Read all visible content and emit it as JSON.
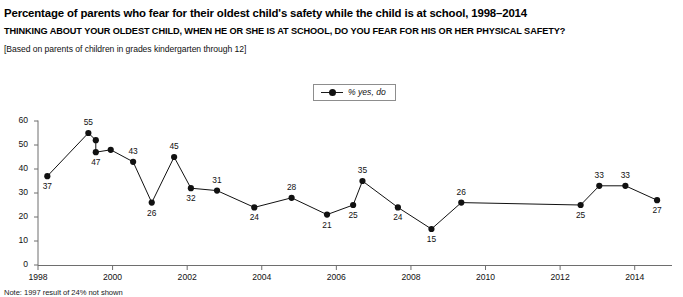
{
  "header": {
    "title": "Percentage of parents who fear for their oldest child's safety while the child is at school, 1998–2014",
    "question": "THINKING ABOUT YOUR OLDEST CHILD, WHEN HE OR SHE IS AT SCHOOL, DO YOU FEAR FOR HIS OR HER PHYSICAL SAFETY?",
    "basis": "[Based on parents of children in grades kindergarten through 12]"
  },
  "legend": {
    "label": "% yes, do",
    "marker_icon": "line-with-dot-marker-icon"
  },
  "footnote": {
    "text": "Note: 1997 result of 24% not shown"
  },
  "chart_data": {
    "type": "line",
    "title": "Percentage of parents who fear for their oldest child's safety while the child is at school, 1998–2014",
    "xlabel": "",
    "ylabel": "",
    "xlim": [
      1998.0,
      2015.0
    ],
    "ylim": [
      0,
      60
    ],
    "grid": false,
    "legend_position": "top-center",
    "series": [
      {
        "name": "% yes, do",
        "color": "#111111",
        "points": [
          {
            "x": 1998.25,
            "y": 37,
            "label": "37",
            "label_pos": "below"
          },
          {
            "x": 1999.35,
            "y": 55,
            "label": "55",
            "label_pos": "above"
          },
          {
            "x": 1999.55,
            "y": 52,
            "label": "",
            "label_pos": "none"
          },
          {
            "x": 1999.55,
            "y": 47,
            "label": "47",
            "label_pos": "below"
          },
          {
            "x": 1999.95,
            "y": 48,
            "label": "",
            "label_pos": "none"
          },
          {
            "x": 2000.55,
            "y": 43,
            "label": "43",
            "label_pos": "above"
          },
          {
            "x": 2001.05,
            "y": 26,
            "label": "26",
            "label_pos": "below"
          },
          {
            "x": 2001.65,
            "y": 45,
            "label": "45",
            "label_pos": "above"
          },
          {
            "x": 2002.1,
            "y": 32,
            "label": "32",
            "label_pos": "below"
          },
          {
            "x": 2002.8,
            "y": 31,
            "label": "31",
            "label_pos": "above"
          },
          {
            "x": 2003.8,
            "y": 24,
            "label": "24",
            "label_pos": "below"
          },
          {
            "x": 2004.8,
            "y": 28,
            "label": "28",
            "label_pos": "above"
          },
          {
            "x": 2005.75,
            "y": 21,
            "label": "21",
            "label_pos": "below"
          },
          {
            "x": 2006.45,
            "y": 25,
            "label": "25",
            "label_pos": "below"
          },
          {
            "x": 2006.7,
            "y": 35,
            "label": "35",
            "label_pos": "above"
          },
          {
            "x": 2007.65,
            "y": 24,
            "label": "24",
            "label_pos": "below"
          },
          {
            "x": 2008.55,
            "y": 15,
            "label": "15",
            "label_pos": "below"
          },
          {
            "x": 2009.35,
            "y": 26,
            "label": "26",
            "label_pos": "above"
          },
          {
            "x": 2012.55,
            "y": 25,
            "label": "25",
            "label_pos": "below"
          },
          {
            "x": 2013.05,
            "y": 33,
            "label": "33",
            "label_pos": "above"
          },
          {
            "x": 2013.75,
            "y": 33,
            "label": "33",
            "label_pos": "above"
          },
          {
            "x": 2014.6,
            "y": 27,
            "label": "27",
            "label_pos": "below"
          }
        ]
      }
    ],
    "yticks": [
      0,
      10,
      20,
      30,
      40,
      50,
      60
    ],
    "ytick_labels": [
      "0",
      "10",
      "20",
      "30",
      "40",
      "50",
      "60"
    ],
    "xticks": [
      1998,
      2000,
      2002,
      2004,
      2006,
      2008,
      2010,
      2012,
      2014
    ],
    "xtick_labels": [
      "1998",
      "2000",
      "2002",
      "2004",
      "2006",
      "2008",
      "2010",
      "2012",
      "2014"
    ]
  }
}
